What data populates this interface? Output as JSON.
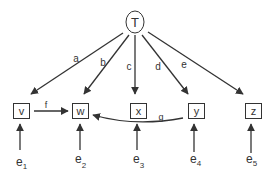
{
  "diagram": {
    "latent": {
      "id": "T",
      "label": "T"
    },
    "observed": [
      {
        "id": "v",
        "label": "v"
      },
      {
        "id": "w",
        "label": "w"
      },
      {
        "id": "x",
        "label": "x"
      },
      {
        "id": "y",
        "label": "y"
      },
      {
        "id": "z",
        "label": "z"
      }
    ],
    "loadings": [
      {
        "from": "T",
        "to": "v",
        "label": "a"
      },
      {
        "from": "T",
        "to": "w",
        "label": "b"
      },
      {
        "from": "T",
        "to": "x",
        "label": "c"
      },
      {
        "from": "T",
        "to": "y",
        "label": "d"
      },
      {
        "from": "T",
        "to": "z",
        "label": "e"
      }
    ],
    "paths": [
      {
        "from": "v",
        "to": "w",
        "label": "f"
      },
      {
        "from": "y",
        "to": "w",
        "label": "g"
      }
    ],
    "errors": [
      {
        "base": "e",
        "sub": "1",
        "to": "v"
      },
      {
        "base": "e",
        "sub": "2",
        "to": "w"
      },
      {
        "base": "e",
        "sub": "3",
        "to": "x"
      },
      {
        "base": "e",
        "sub": "4",
        "to": "y"
      },
      {
        "base": "e",
        "sub": "5",
        "to": "z"
      }
    ],
    "colors": {
      "stroke": "#333333",
      "background": "#ffffff"
    }
  }
}
